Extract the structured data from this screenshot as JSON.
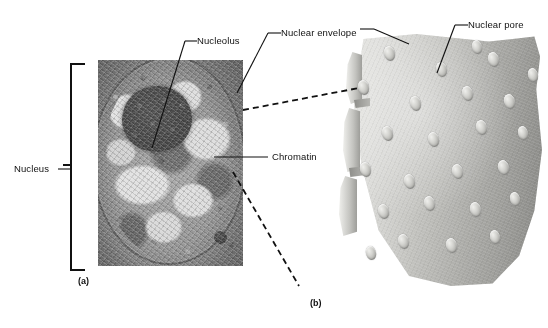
{
  "figure": {
    "title_present": false,
    "panels": [
      {
        "id": "a",
        "caption": "(a)",
        "type": "electron-micrograph",
        "subject": "nucleus"
      },
      {
        "id": "b",
        "caption": "(b)",
        "type": "freeze-fracture-diagram",
        "subject": "nuclear envelope surface with nuclear pores"
      }
    ]
  },
  "labels": {
    "nucleus": "Nucleus",
    "nucleolus": "Nucleolus",
    "nuclear_envelope": "Nuclear envelope",
    "chromatin": "Chromatin",
    "nuclear_pore": "Nuclear pore"
  },
  "captions": {
    "a": "(a)",
    "b": "(b)"
  },
  "colors": {
    "background": "#ffffff",
    "line": "#111111",
    "text": "#111111",
    "micrograph_mid": "#8d8d8d",
    "nucleolus_dark": "#3c3c3c",
    "membrane_light": "#d8d8d4",
    "membrane_dark": "#a9a9a5",
    "pore_highlight": "#efefec"
  },
  "pores": [
    {
      "x": 32,
      "y": 12,
      "w": 11,
      "h": 15
    },
    {
      "x": 84,
      "y": 28,
      "w": 11,
      "h": 15
    },
    {
      "x": 136,
      "y": 18,
      "w": 11,
      "h": 15
    },
    {
      "x": 176,
      "y": 34,
      "w": 10,
      "h": 14
    },
    {
      "x": 6,
      "y": 46,
      "w": 11,
      "h": 15
    },
    {
      "x": 58,
      "y": 62,
      "w": 11,
      "h": 15
    },
    {
      "x": 110,
      "y": 52,
      "w": 11,
      "h": 15
    },
    {
      "x": 152,
      "y": 60,
      "w": 11,
      "h": 15
    },
    {
      "x": 30,
      "y": 92,
      "w": 11,
      "h": 15
    },
    {
      "x": 76,
      "y": 98,
      "w": 11,
      "h": 15
    },
    {
      "x": 124,
      "y": 86,
      "w": 11,
      "h": 15
    },
    {
      "x": 166,
      "y": 92,
      "w": 10,
      "h": 14
    },
    {
      "x": 8,
      "y": 128,
      "w": 11,
      "h": 15
    },
    {
      "x": 52,
      "y": 140,
      "w": 11,
      "h": 15
    },
    {
      "x": 100,
      "y": 130,
      "w": 11,
      "h": 15
    },
    {
      "x": 146,
      "y": 126,
      "w": 11,
      "h": 15
    },
    {
      "x": 26,
      "y": 170,
      "w": 11,
      "h": 15
    },
    {
      "x": 72,
      "y": 162,
      "w": 11,
      "h": 15
    },
    {
      "x": 118,
      "y": 168,
      "w": 11,
      "h": 15
    },
    {
      "x": 158,
      "y": 158,
      "w": 10,
      "h": 14
    },
    {
      "x": 46,
      "y": 200,
      "w": 11,
      "h": 15
    },
    {
      "x": 94,
      "y": 204,
      "w": 11,
      "h": 15
    },
    {
      "x": 138,
      "y": 196,
      "w": 10,
      "h": 14
    },
    {
      "x": 14,
      "y": 212,
      "w": 10,
      "h": 14
    },
    {
      "x": 120,
      "y": 6,
      "w": 10,
      "h": 14
    }
  ]
}
